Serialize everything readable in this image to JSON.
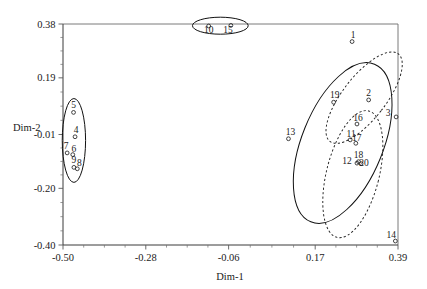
{
  "chart_data": {
    "type": "scatter",
    "title": "",
    "subtitle": "",
    "xlabel": "Dim-1",
    "ylabel": "Dim-2",
    "xlim": [
      -0.5,
      0.39
    ],
    "ylim": [
      -0.4,
      0.38
    ],
    "grid": false,
    "legend": null,
    "xticks": [
      -0.5,
      -0.28,
      -0.06,
      0.17,
      0.39
    ],
    "xtick_labels": [
      "-0.50",
      "-0.28",
      "-0.06",
      "0.17",
      "0.39"
    ],
    "yticks": [
      -0.4,
      -0.2,
      -0.01,
      0.19,
      0.38
    ],
    "ytick_labels": [
      "-0.40",
      "-0.20",
      "-0.01",
      "0.19",
      "0.38"
    ],
    "marker": "open-circle",
    "points": [
      {
        "label": "1",
        "x": 0.268,
        "y": 0.318,
        "label_dx": 1,
        "label_dy": -4
      },
      {
        "label": "2",
        "x": 0.312,
        "y": 0.112,
        "label_dx": 0,
        "label_dy": -4
      },
      {
        "label": "3",
        "x": 0.385,
        "y": 0.052,
        "label_dx": -8,
        "label_dy": -1
      },
      {
        "label": "4",
        "x": -0.468,
        "y": -0.018,
        "label_dx": 1,
        "label_dy": -4
      },
      {
        "label": "5",
        "x": -0.472,
        "y": 0.068,
        "label_dx": 0,
        "label_dy": -4
      },
      {
        "label": "6",
        "x": -0.474,
        "y": -0.081,
        "label_dx": 1,
        "label_dy": -3
      },
      {
        "label": "7",
        "x": -0.489,
        "y": -0.075,
        "label_dx": -1,
        "label_dy": -4
      },
      {
        "label": "8",
        "x": -0.462,
        "y": -0.131,
        "label_dx": 2,
        "label_dy": -3
      },
      {
        "label": "9",
        "x": -0.471,
        "y": -0.126,
        "label_dx": 0,
        "label_dy": -4
      },
      {
        "label": "10",
        "x": -0.113,
        "y": 0.373,
        "label_dx": 0,
        "label_dy": 7
      },
      {
        "label": "11",
        "x": 0.263,
        "y": -0.029,
        "label_dx": 1,
        "label_dy": -3
      },
      {
        "label": "12",
        "x": 0.281,
        "y": -0.111,
        "label_dx": -10,
        "label_dy": 1
      },
      {
        "label": "13",
        "x": 0.099,
        "y": -0.025,
        "label_dx": 2,
        "label_dy": -4
      },
      {
        "label": "14",
        "x": 0.383,
        "y": -0.386,
        "label_dx": -4,
        "label_dy": -3
      },
      {
        "label": "15",
        "x": -0.054,
        "y": 0.375,
        "label_dx": -3,
        "label_dy": 8
      },
      {
        "label": "16",
        "x": 0.281,
        "y": 0.027,
        "label_dx": 1,
        "label_dy": -3
      },
      {
        "label": "17",
        "x": 0.278,
        "y": -0.041,
        "label_dx": 1,
        "label_dy": -2
      },
      {
        "label": "18",
        "x": 0.285,
        "y": -0.106,
        "label_dx": 0,
        "label_dy": -4
      },
      {
        "label": "19",
        "x": 0.219,
        "y": 0.104,
        "label_dx": 1,
        "label_dy": -4
      },
      {
        "label": "20",
        "x": 0.292,
        "y": -0.113,
        "label_dx": 3,
        "label_dy": 2
      }
    ],
    "ellipses": [
      {
        "name": "cluster-top",
        "style": "solid",
        "cx": -0.082,
        "cy": 0.374,
        "rx": 0.074,
        "ry": 0.03,
        "rotation": 0
      },
      {
        "name": "cluster-left",
        "style": "solid",
        "cx": -0.471,
        "cy": -0.031,
        "rx": 0.031,
        "ry": 0.148,
        "rotation": 0
      },
      {
        "name": "cluster-right",
        "style": "solid",
        "cx": 0.243,
        "cy": -0.04,
        "rx": 0.108,
        "ry": 0.3,
        "rotation": 22
      },
      {
        "name": "cluster-right-a",
        "style": "dashed",
        "cx": 0.3,
        "cy": 0.12,
        "rx": 0.057,
        "ry": 0.196,
        "rotation": 38
      },
      {
        "name": "cluster-right-b",
        "style": "dashed",
        "cx": 0.27,
        "cy": -0.15,
        "rx": 0.07,
        "ry": 0.23,
        "rotation": 14
      }
    ]
  },
  "axes": {
    "x_title": "Dim-1",
    "y_title": "Dim-2"
  }
}
